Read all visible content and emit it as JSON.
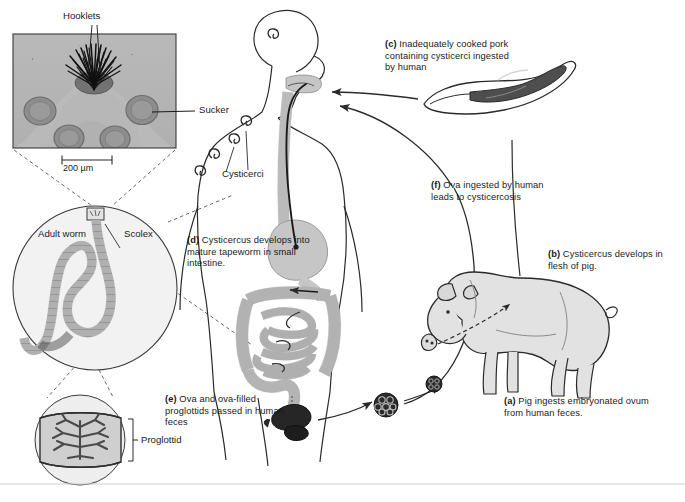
{
  "figure": {
    "background": "#ffffff",
    "ink": "#1a1a1a"
  },
  "micrograph": {
    "hooklets_label": "Hooklets",
    "sucker_label": "Sucker",
    "scale_bar_label": "200 µm"
  },
  "worm_inset": {
    "adult_worm_label": "Adult worm",
    "scolex_label": "Scolex",
    "proglottid_label": "Proglottid"
  },
  "human": {
    "cysticerci_label": "Cysticerci"
  },
  "steps": [
    {
      "key": "a",
      "tag": "(a)",
      "text": "Pig ingests embryonated ovum from human feces."
    },
    {
      "key": "b",
      "tag": "(b)",
      "text": "Cysticercus develops in flesh of pig."
    },
    {
      "key": "c",
      "tag": "(c)",
      "text": "Inadequately cooked pork containing cysticerci ingested by human"
    },
    {
      "key": "d",
      "tag": "(d)",
      "text": "Cysticercus develops into mature tapeworm in small intestine."
    },
    {
      "key": "e",
      "tag": "(e)",
      "text": "Ova and ova-filled proglottids passed in human feces"
    },
    {
      "key": "f",
      "tag": "(f)",
      "text": "Ova ingested by human leads to cysticercosis"
    }
  ],
  "colors": {
    "ink": "#1a1a1a",
    "tissue_gray": "#c9c9c9",
    "organ_gray": "#bdbdbd",
    "dark_specimen": "#2e2e2e",
    "micrograph_bg": "#b4b4b4",
    "inset_fill": "#efefef"
  }
}
